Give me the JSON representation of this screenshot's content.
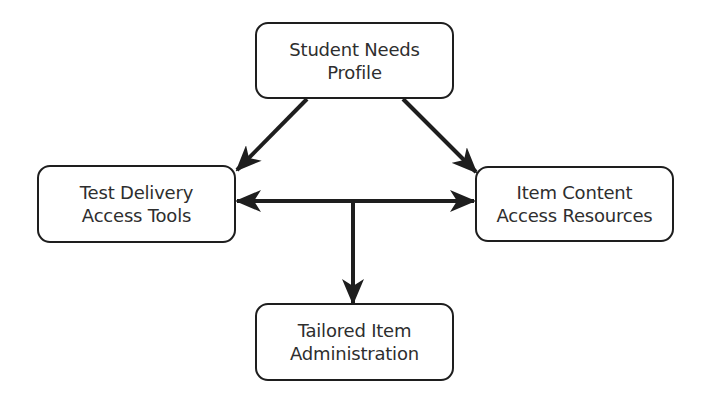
{
  "diagram": {
    "type": "flow",
    "colors": {
      "background": "#ffffff",
      "stroke": "#1e1e1e",
      "text": "#2e2e2e"
    },
    "nodes": {
      "top": {
        "id": "student-needs-profile",
        "line1": "Student Needs",
        "line2": "Profile"
      },
      "left": {
        "id": "test-delivery-access-tools",
        "line1": "Test Delivery",
        "line2": "Access Tools"
      },
      "right": {
        "id": "item-content-access-resources",
        "line1": "Item Content",
        "line2": "Access Resources"
      },
      "bottom": {
        "id": "tailored-item-administration",
        "line1": "Tailored Item",
        "line2": "Administration"
      }
    },
    "edges": [
      {
        "from": "Student Needs Profile",
        "to": "Test Delivery Access Tools",
        "style": "arrow"
      },
      {
        "from": "Student Needs Profile",
        "to": "Item Content Access Resources",
        "style": "arrow"
      },
      {
        "from": "Test Delivery Access Tools",
        "to": "Item Content Access Resources",
        "style": "double-arrow"
      },
      {
        "from": "Test Delivery / Item Content link",
        "to": "Tailored Item Administration",
        "style": "arrow"
      }
    ]
  }
}
